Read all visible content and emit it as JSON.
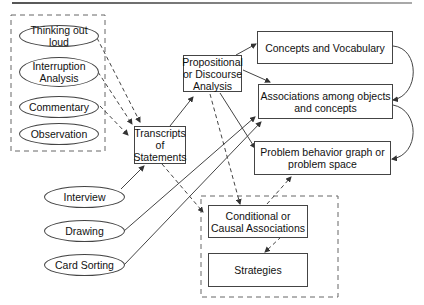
{
  "diagram": {
    "methods_group": {
      "items": [
        {
          "label": "Thinking out loud"
        },
        {
          "label": "Interruption\nAnalysis"
        },
        {
          "label": "Commentary"
        },
        {
          "label": "Observation"
        }
      ]
    },
    "other_methods": [
      {
        "label": "Interview"
      },
      {
        "label": "Drawing"
      },
      {
        "label": "Card Sorting"
      }
    ],
    "transcripts": {
      "label": "Transcripts\nof\nStatements"
    },
    "propositional": {
      "label": "Propositional\nor Discourse\nAnalysis"
    },
    "outputs": [
      {
        "label": "Concepts and Vocabulary"
      },
      {
        "label": "Associations among objects\nand concepts"
      },
      {
        "label": "Problem behavior graph or\nproblem space"
      }
    ],
    "bottom_group": {
      "items": [
        {
          "label": "Conditional or\nCausal Associations"
        },
        {
          "label": "Strategies"
        }
      ]
    },
    "colors": {
      "line": "#444444",
      "text": "#111111",
      "background": "#ffffff"
    }
  }
}
